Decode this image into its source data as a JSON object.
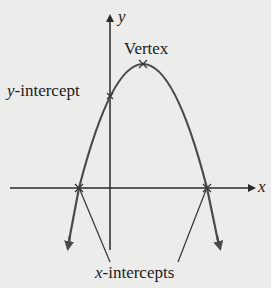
{
  "figure": {
    "axis_labels": {
      "x": "x",
      "y": "y"
    },
    "annotations": {
      "vertex": "Vertex",
      "y_intercept_var": "y",
      "y_intercept_suffix": "-intercept",
      "x_intercepts_var": "x",
      "x_intercepts_suffix": "-intercepts"
    },
    "colors": {
      "curve": "#4a4a4a",
      "axes": "#2a2a2a",
      "text": "#1c1c1c",
      "background": "#ececea"
    }
  }
}
